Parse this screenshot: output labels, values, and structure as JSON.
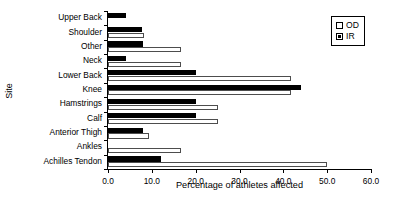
{
  "chart_data": {
    "type": "bar",
    "orientation": "horizontal",
    "title": "",
    "xlabel": "Percentage of athletes affected",
    "ylabel": "Site",
    "xlim": [
      0.0,
      60.0
    ],
    "xticks": [
      "0.0",
      "10.0",
      "20.0",
      "30.0",
      "40.0",
      "50.0",
      "60.0"
    ],
    "xtick_values": [
      0,
      10,
      20,
      30,
      40,
      50,
      60
    ],
    "grid": false,
    "legend_position": "top-right",
    "categories": [
      "Upper Back",
      "Shoulder",
      "Other",
      "Neck",
      "Lower Back",
      "Knee",
      "Hamstrings",
      "Calf",
      "Anterior Thigh",
      "Ankles",
      "Achilles Tendon"
    ],
    "series": [
      {
        "name": "OD",
        "color": "#ffffff",
        "values": [
          0.0,
          8.3,
          16.7,
          16.7,
          41.7,
          41.7,
          25.0,
          25.0,
          9.4,
          16.7,
          50.0
        ]
      },
      {
        "name": "IR",
        "color": "#000000",
        "values": [
          4.0,
          7.8,
          8.0,
          4.0,
          20.0,
          44.0,
          20.0,
          20.0,
          8.0,
          0.0,
          12.0
        ]
      }
    ]
  },
  "legend": {
    "items": [
      {
        "label": "OD",
        "swatch": "white-square"
      },
      {
        "label": "IR",
        "swatch": "black-square"
      }
    ]
  }
}
